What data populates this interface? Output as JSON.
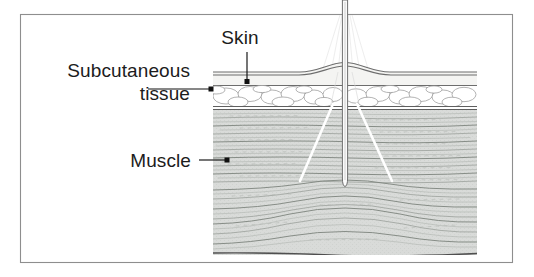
{
  "figure": {
    "background_color": "#ffffff",
    "border_color": "#8e8e8e",
    "width": 534,
    "height": 277
  },
  "labels": {
    "skin": {
      "text": "Skin",
      "x": 240,
      "y": 44,
      "anchor": "middle"
    },
    "subcutaneous_line1": {
      "text": "Subcutaneous",
      "x": 190,
      "y": 77,
      "anchor": "end"
    },
    "subcutaneous_line2": {
      "text": "tissue",
      "x": 190,
      "y": 100,
      "anchor": "end"
    },
    "muscle": {
      "text": "Muscle",
      "x": 191,
      "y": 167,
      "anchor": "end"
    }
  },
  "leaders": {
    "skin": {
      "path": "M 247 52 L 247 80",
      "dot_x": 247,
      "dot_y": 81.5
    },
    "subcutaneous": {
      "path": "M 150 89 L 210 89",
      "dot_x": 211.5,
      "dot_y": 89
    },
    "muscle": {
      "path": "M 199 160 L 226 160",
      "dot_x": 227.5,
      "dot_y": 160
    }
  },
  "tissue_block": {
    "left": 213,
    "right": 477,
    "top": 62,
    "bottom": 255,
    "layers": [
      {
        "name": "skin",
        "label": "Skin",
        "top": 71,
        "bottom": 86,
        "fill": "#f2f2f0",
        "description": "epidermis and dermis with tented bulge at needle entry"
      },
      {
        "name": "subcutaneous",
        "label": "Subcutaneous tissue",
        "top": 86,
        "bottom": 107,
        "fill": "#ffffff",
        "description": "adipose lobules outlined as rounded cells"
      },
      {
        "name": "muscle",
        "label": "Muscle",
        "top": 107,
        "bottom": 255,
        "fill": "#d9dbd9",
        "description": "horizontal wavy muscle fiber striations with curved bundles near base"
      }
    ]
  },
  "needle": {
    "name": "injection-needle",
    "center_x": 345,
    "top_y": 0,
    "tip_y": 186,
    "shaft_half_width": 2.6,
    "color": "#6f6f6f"
  },
  "beam": {
    "name": "white-divergence-lines",
    "color": "#ffffff",
    "left_path": "M 333 105 L 300 180",
    "right_path": "M 357 105 L 392 180",
    "faint_color": "#d8d8d8"
  },
  "colors": {
    "muscle_fill": "#d9dbd9",
    "muscle_fiber": "#9ba09b",
    "fat_fill": "#ffffff",
    "fat_outline": "#9a9a9a",
    "skin_stroke": "#6d6d6d",
    "text": "#1c1c1c",
    "leader": "#111111",
    "beam_white": "#ffffff"
  }
}
